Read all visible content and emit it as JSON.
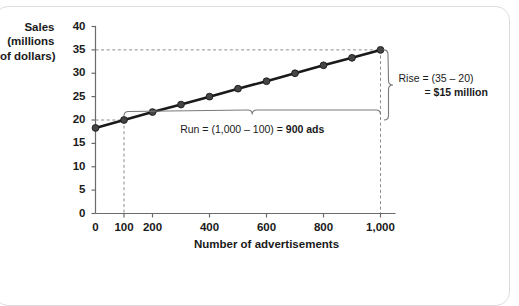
{
  "chart_data": {
    "type": "line",
    "title": "",
    "xlabel": "Number of advertisements",
    "ylabel": "Sales (millions of dollars)",
    "ylabel_lines": [
      "Sales",
      "(millions",
      "of dollars)"
    ],
    "xlim": [
      0,
      1000
    ],
    "ylim": [
      0,
      40
    ],
    "grid": false,
    "legend": "none",
    "x": [
      0,
      100,
      200,
      300,
      400,
      500,
      600,
      700,
      800,
      900,
      1000
    ],
    "values": [
      18.3,
      20.0,
      21.7,
      23.3,
      25.0,
      26.7,
      28.3,
      30.0,
      31.7,
      33.3,
      35.0
    ],
    "series": [
      {
        "name": "Sales",
        "values": [
          18.3,
          20.0,
          21.7,
          23.3,
          25.0,
          26.7,
          28.3,
          30.0,
          31.7,
          33.3,
          35.0
        ]
      }
    ],
    "xticks": [
      0,
      100,
      200,
      400,
      600,
      800,
      1000
    ],
    "xtick_labels": [
      "0",
      "100",
      "200",
      "400",
      "600",
      "800",
      "1,000"
    ],
    "yticks": [
      0,
      5,
      10,
      15,
      20,
      25,
      30,
      35,
      40
    ],
    "ytick_labels": [
      "0",
      "5",
      "10",
      "15",
      "20",
      "25",
      "30",
      "35",
      "40"
    ],
    "annotations": {
      "rise_line1": "Rise = (35 – 20)",
      "rise_line2_prefix": "= ",
      "rise_line2_bold": "$15 million",
      "run_prefix": "Run = (1,000 – 100) = ",
      "run_bold": "900 ads"
    },
    "guides": {
      "horizontal_dashed": [
        20,
        35
      ],
      "vertical_dashed": [
        100,
        1000
      ]
    },
    "colors": {
      "line": "#1a1a1a",
      "marker": "#404040",
      "axis": "#6b6b6b",
      "dashed": "#8c8c8c",
      "bracket": "#7a7a7a",
      "card_border": "#dcdcdc",
      "text": "#1a1a1a"
    }
  }
}
